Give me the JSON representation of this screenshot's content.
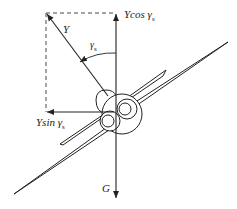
{
  "diagram": {
    "type": "force-diagram",
    "colors": {
      "line": "#222222",
      "background": "#ffffff"
    },
    "labels": {
      "lift": "Y",
      "vertical_component": "Ycos γ",
      "vertical_component_sub": "s",
      "horizontal_component": "Ysin γ",
      "horizontal_component_sub": "s",
      "bank_angle": "γ",
      "bank_angle_sub": "s",
      "weight": "G"
    }
  }
}
